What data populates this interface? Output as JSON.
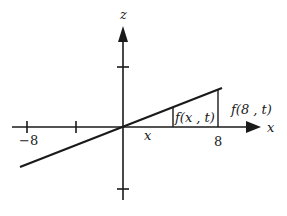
{
  "diagram": {
    "axes": {
      "x_label": "x",
      "z_label": "z",
      "x_ticks": [
        "-8",
        "8"
      ],
      "x_tick_label_left": "−8",
      "x_tick_label_right": "8"
    },
    "annotations": {
      "f_x_t": "f(x , t)",
      "f_8_t": "f(8 , t)",
      "x_marker": "x"
    },
    "colors": {
      "ink": "#1a1a1a",
      "background": "#ffffff"
    }
  }
}
